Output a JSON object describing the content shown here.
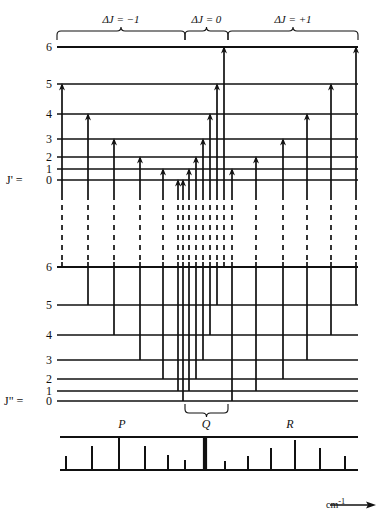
{
  "figure": {
    "kind": "rovibrational-energy-level-diagram",
    "axis_unit_label": "cm",
    "axis_unit_exponent": "-1",
    "upper_state_label": "J'  =",
    "lower_state_label": "J\"  =",
    "upper_levels": [
      "6",
      "5",
      "4",
      "3",
      "2",
      "1",
      "0"
    ],
    "lower_levels": [
      "6",
      "5",
      "4",
      "3",
      "2",
      "1",
      "0"
    ],
    "branch_headers": [
      {
        "name": "delta-j-minus-one",
        "text": "ΔJ  =  −1"
      },
      {
        "name": "delta-j-zero",
        "text": "ΔJ  =  0"
      },
      {
        "name": "delta-j-plus-one",
        "text": "ΔJ  =  +1"
      }
    ],
    "branch_labels": [
      {
        "name": "p-branch-label",
        "text": "P"
      },
      {
        "name": "q-branch-label",
        "text": "Q"
      },
      {
        "name": "r-branch-label",
        "text": "R"
      }
    ]
  },
  "chart_data": {
    "type": "line",
    "title": "",
    "xlabel": "cm-1",
    "ylabel": "",
    "grid": false,
    "legend": null,
    "upper_level_y": {
      "6": 47,
      "5": 84,
      "4": 114,
      "3": 139,
      "2": 157,
      "1": 169,
      "0": 180
    },
    "lower_level_y": {
      "6": 267,
      "5": 305,
      "4": 335,
      "3": 360,
      "2": 379,
      "1": 391,
      "0": 401
    },
    "ladder_x_range": [
      57,
      358
    ],
    "branch_ranges": {
      "P": [
        57,
        185
      ],
      "Q": [
        185,
        228
      ],
      "R": [
        228,
        358
      ]
    },
    "p_branch_transitions": [
      {
        "x": 62,
        "J_lower": 6,
        "J_upper": 5
      },
      {
        "x": 88,
        "J_lower": 5,
        "J_upper": 4
      },
      {
        "x": 114,
        "J_lower": 4,
        "J_upper": 3
      },
      {
        "x": 140,
        "J_lower": 3,
        "J_upper": 2
      },
      {
        "x": 163,
        "J_lower": 2,
        "J_upper": 1
      },
      {
        "x": 178,
        "J_lower": 1,
        "J_upper": 0
      }
    ],
    "q_branch_transitions": [
      {
        "x": 183,
        "J_lower": 0,
        "J_upper": 0
      },
      {
        "x": 189,
        "J_lower": 1,
        "J_upper": 1
      },
      {
        "x": 196,
        "J_lower": 2,
        "J_upper": 2
      },
      {
        "x": 203,
        "J_lower": 3,
        "J_upper": 3
      },
      {
        "x": 210,
        "J_lower": 4,
        "J_upper": 4
      },
      {
        "x": 217,
        "J_lower": 5,
        "J_upper": 5
      },
      {
        "x": 224,
        "J_lower": 6,
        "J_upper": 6
      }
    ],
    "r_branch_transitions": [
      {
        "x": 232,
        "J_lower": 0,
        "J_upper": 1
      },
      {
        "x": 256,
        "J_lower": 1,
        "J_upper": 2
      },
      {
        "x": 283,
        "J_lower": 2,
        "J_upper": 3
      },
      {
        "x": 307,
        "J_lower": 3,
        "J_upper": 4
      },
      {
        "x": 331,
        "J_lower": 4,
        "J_upper": 5
      },
      {
        "x": 356,
        "J_lower": 5,
        "J_upper": 6
      }
    ],
    "spectrum_baseline_y": 470,
    "spectrum_top_y": 437,
    "spectrum_x_range": [
      60,
      358
    ],
    "spectrum_lines": [
      {
        "x": 66,
        "height": 14,
        "branch": "P",
        "width": 2
      },
      {
        "x": 92,
        "height": 24,
        "branch": "P",
        "width": 2
      },
      {
        "x": 119,
        "height": 33,
        "branch": "P",
        "width": 2
      },
      {
        "x": 145,
        "height": 24,
        "branch": "P",
        "width": 2
      },
      {
        "x": 168,
        "height": 15,
        "branch": "P",
        "width": 2
      },
      {
        "x": 185,
        "height": 10,
        "branch": "P",
        "width": 2
      },
      {
        "x": 205,
        "height": 33,
        "branch": "Q",
        "width": 4
      },
      {
        "x": 225,
        "height": 9,
        "branch": "R",
        "width": 2
      },
      {
        "x": 248,
        "height": 14,
        "branch": "R",
        "width": 2
      },
      {
        "x": 271,
        "height": 22,
        "branch": "R",
        "width": 2
      },
      {
        "x": 295,
        "height": 30,
        "branch": "R",
        "width": 2
      },
      {
        "x": 320,
        "height": 22,
        "branch": "R",
        "width": 2
      },
      {
        "x": 345,
        "height": 14,
        "branch": "R",
        "width": 2
      }
    ]
  }
}
